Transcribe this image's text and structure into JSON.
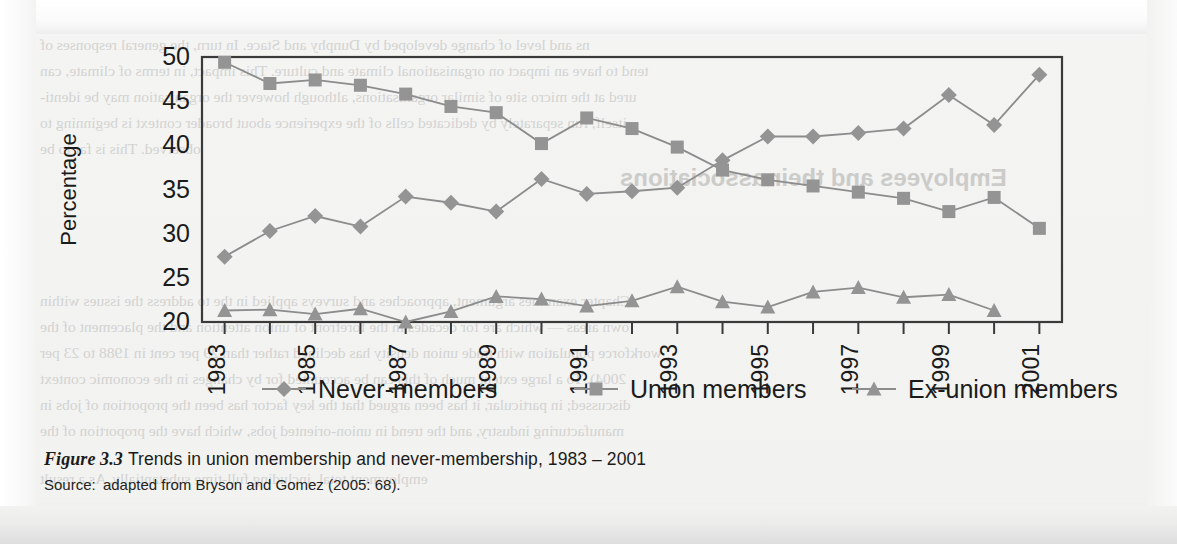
{
  "figure": {
    "label": "Figure 3.3",
    "title": "Trends in union membership and never-membership, 1983 – 2001",
    "source_label": "Source:",
    "source_text": "adapted from Bryson and Gomez (2005: 68)."
  },
  "colors": {
    "series_marker": "#949494",
    "series_line": "#8c8c8c",
    "axis": "#3a3a3a",
    "text": "#1b1b1b",
    "plot_background": "#f1f1f0"
  },
  "chart_data": {
    "type": "line",
    "title": "Trends in union membership and never-membership, 1983 – 2001",
    "xlabel": "",
    "ylabel": "Percentage",
    "ylim": [
      20,
      50
    ],
    "ytick_step": 5,
    "yticks": [
      20,
      25,
      30,
      35,
      40,
      45,
      50
    ],
    "grid": false,
    "legend_position": "below",
    "x": [
      1983,
      1984,
      1985,
      1986,
      1987,
      1988,
      1989,
      1990,
      1991,
      1992,
      1993,
      1994,
      1995,
      1996,
      1997,
      1998,
      1999,
      2000,
      2001
    ],
    "xtick_labels": [
      "1983",
      "",
      "1985",
      "",
      "1987",
      "",
      "1989",
      "",
      "1991",
      "",
      "1993",
      "",
      "1995",
      "",
      "1997",
      "",
      "1999",
      "",
      "2001"
    ],
    "xtick_labels_rotated": true,
    "series": [
      {
        "name": "Never-members",
        "marker": "diamond",
        "values": [
          27.4,
          30.3,
          32.0,
          30.8,
          34.2,
          33.5,
          32.5,
          36.2,
          34.5,
          34.8,
          35.2,
          38.3,
          41.0,
          41.0,
          41.4,
          41.9,
          45.7,
          42.3,
          48.0
        ]
      },
      {
        "name": "Union members",
        "marker": "square",
        "values": [
          49.4,
          47.0,
          47.4,
          46.8,
          45.8,
          44.4,
          43.7,
          40.2,
          43.1,
          41.9,
          39.8,
          37.2,
          36.1,
          35.4,
          34.7,
          34.0,
          32.5,
          34.1,
          30.6
        ]
      },
      {
        "name": "Ex-union members",
        "marker": "triangle",
        "values": [
          21.3,
          21.4,
          20.9,
          21.5,
          20.0,
          21.2,
          22.9,
          22.6,
          21.8,
          22.4,
          24.0,
          22.3,
          21.7,
          23.4,
          23.9,
          22.8,
          23.1,
          21.3,
          null
        ]
      }
    ]
  },
  "background_ghost_text": {
    "lines": [
      "ns and level of change developed by Dunphy and Stace. In turn, the general responses of",
      "tend to have an impact on organisational climate and culture. This impact, in terms of climate, can",
      "ured at the micro site of similar organisations, although however the organisation may be identi-",
      "itself, run separately by dedicated cells of the experience about broader context is beginning to",
      "observed. This is far to be",
      "Chapter examines argument, approaches and surveys applied in the to address the issues within",
      "own areas — which are for decades in the forefront of union attention and the placement of the",
      "workforce population with trade union density has declined rather than 29 per cent in 1988 to 23 per",
      "2004). To a large extent much of this can be accounted for by changes in the economic context",
      "discussed; in particular, it has been argued that the key factor has been the proportion of jobs in",
      "manufacturing industry, and the trend in union-oriented jobs, which have the proportion of the",
      "employment total, including full-time substantially. As a result"
    ],
    "heading": "Employees and their associations"
  }
}
